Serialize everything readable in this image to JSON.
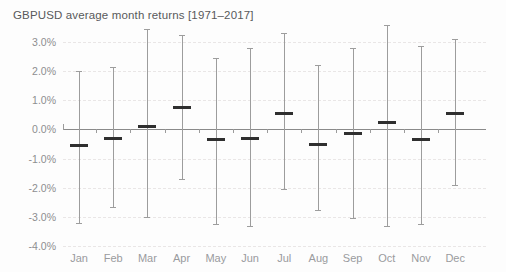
{
  "chart_data": {
    "type": "bar",
    "title": "GBPUSD average month returns [1971–2017]",
    "xlabel": "",
    "ylabel": "",
    "ylim": [
      -4.0,
      3.0
    ],
    "grid": true,
    "legend": null,
    "yticks": [
      "3.0%",
      "2.0%",
      "1.0%",
      "0.0%",
      "-1.0%",
      "-2.0%",
      "-3.0%",
      "-4.0%"
    ],
    "ytick_values": [
      3.0,
      2.0,
      1.0,
      0.0,
      -1.0,
      -2.0,
      -3.0,
      -4.0
    ],
    "categories": [
      "Jan",
      "Feb",
      "Mar",
      "Apr",
      "May",
      "Jun",
      "Jul",
      "Aug",
      "Sep",
      "Oct",
      "Nov",
      "Dec"
    ],
    "values": [
      -0.55,
      -0.3,
      0.1,
      0.75,
      -0.35,
      -0.3,
      0.55,
      -0.5,
      -0.15,
      0.25,
      -0.35,
      0.55
    ],
    "series": [
      {
        "name": "Average month return",
        "values": [
          -0.55,
          -0.3,
          0.1,
          0.75,
          -0.35,
          -0.3,
          0.55,
          -0.5,
          -0.15,
          0.25,
          -0.35,
          0.55
        ]
      },
      {
        "name": "Range high",
        "values": [
          2.0,
          2.15,
          3.45,
          3.25,
          2.45,
          2.8,
          3.3,
          2.2,
          2.8,
          3.6,
          2.85,
          3.1
        ]
      },
      {
        "name": "Range low",
        "values": [
          -3.2,
          -2.65,
          -3.0,
          -1.7,
          -3.25,
          -3.3,
          -2.05,
          -2.75,
          -3.05,
          -3.3,
          -3.25,
          -1.9
        ]
      }
    ],
    "points": [
      {
        "month": "Jan",
        "value": -0.55,
        "high": 2.0,
        "low": -3.2
      },
      {
        "month": "Feb",
        "value": -0.3,
        "high": 2.15,
        "low": -2.65
      },
      {
        "month": "Mar",
        "value": 0.1,
        "high": 3.45,
        "low": -3.0
      },
      {
        "month": "Apr",
        "value": 0.75,
        "high": 3.25,
        "low": -1.7
      },
      {
        "month": "May",
        "value": -0.35,
        "high": 2.45,
        "low": -3.25
      },
      {
        "month": "Jun",
        "value": -0.3,
        "high": 2.8,
        "low": -3.3
      },
      {
        "month": "Jul",
        "value": 0.55,
        "high": 3.3,
        "low": -2.05
      },
      {
        "month": "Aug",
        "value": -0.5,
        "high": 2.2,
        "low": -2.75
      },
      {
        "month": "Sep",
        "value": -0.15,
        "high": 2.8,
        "low": -3.05
      },
      {
        "month": "Oct",
        "value": 0.25,
        "high": 3.6,
        "low": -3.3
      },
      {
        "month": "Nov",
        "value": -0.35,
        "high": 2.85,
        "low": -3.25
      },
      {
        "month": "Dec",
        "value": 0.55,
        "high": 3.1,
        "low": -1.9
      }
    ],
    "colors": {
      "background": "#fdfdfd",
      "title": "#58595b",
      "tick_label": "#8d8e90",
      "gridline": "#e9e6e6",
      "axis": "#8a8a8a",
      "whisker": "#9d9d9d",
      "median": "#2f2f2f"
    }
  }
}
